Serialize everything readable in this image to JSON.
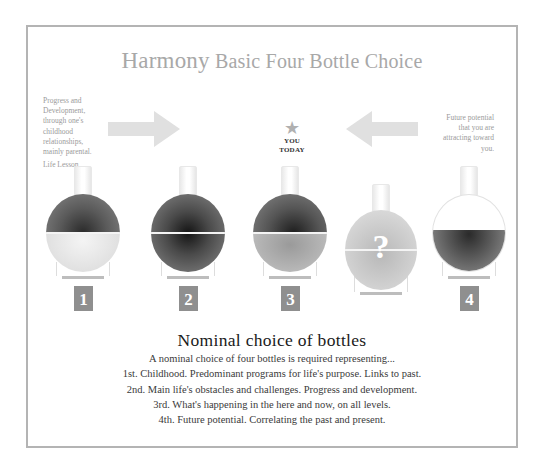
{
  "title": {
    "lead": "Harmony",
    "rest": " Basic Four Bottle Choice"
  },
  "notes": {
    "left_lines": [
      "Progress and",
      "Development,",
      "through one's",
      "childhood",
      "relationships,",
      "mainly parental."
    ],
    "left_label": "Life Lesson",
    "right_lines": [
      "Future potential",
      "that you are",
      "attracting toward",
      "you."
    ]
  },
  "arrows": {
    "left_direction": "right",
    "right_direction": "left",
    "color": "#e0e0e0"
  },
  "marker": {
    "icon": "star-icon",
    "glyph": "★",
    "line1": "YOU",
    "line2": "TODAY"
  },
  "bottles": [
    {
      "number": "1",
      "top_fill": "dark",
      "bottom_fill": "light"
    },
    {
      "number": "2",
      "top_fill": "dark",
      "bottom_fill": "dark"
    },
    {
      "number": "3",
      "top_fill": "dark",
      "bottom_fill": "medium"
    },
    {
      "number": "?",
      "top_fill": "light",
      "bottom_fill": "light",
      "label": "?"
    },
    {
      "number": "4",
      "top_fill": "empty",
      "bottom_fill": "dark"
    }
  ],
  "section": {
    "heading": "Nominal choice of bottles",
    "lines": [
      "A nominal choice of four bottles is required representing...",
      "1st. Childhood. Predominant programs for life's purpose. Links to past.",
      "2nd. Main life's obstacles and challenges. Progress and development.",
      "3rd. What's happening in the here and now, on all levels.",
      "4th. Future potential. Correlating the past and present."
    ]
  },
  "colors": {
    "frame": "#b4b4b4",
    "title": "#a8a8a8",
    "number_box": "#8f8f8f"
  }
}
